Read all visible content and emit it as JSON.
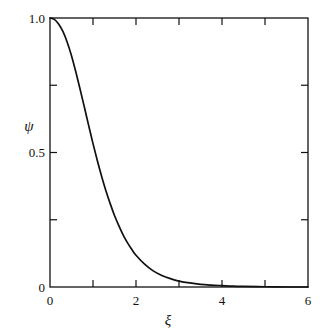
{
  "figure": {
    "background_color": "#ffffff",
    "frame_color": "#111111",
    "curve_color": "#111111"
  },
  "chart_data": {
    "type": "line",
    "title": "",
    "subtitle": "",
    "xlabel": "ξ",
    "ylabel": "ψ",
    "xlim": [
      0,
      6
    ],
    "ylim": [
      0,
      1.0
    ],
    "grid": false,
    "legend": false,
    "legend_position": "none",
    "x_ticks_major": [
      0,
      2,
      4,
      6
    ],
    "x_tick_labels": [
      "0",
      "2",
      "4",
      "6"
    ],
    "x_ticks_minor": [
      1,
      3,
      5
    ],
    "y_ticks_major": [
      0,
      0.5,
      1.0
    ],
    "y_tick_labels": [
      "0",
      "0.5",
      "1.0"
    ],
    "y_ticks_minor": [
      0.25,
      0.75
    ],
    "series": [
      {
        "name": "ψ(ξ)",
        "x": [
          0.0,
          0.1,
          0.2,
          0.3,
          0.4,
          0.5,
          0.6,
          0.7,
          0.8,
          0.9,
          1.0,
          1.1,
          1.2,
          1.3,
          1.4,
          1.5,
          1.6,
          1.7,
          1.8,
          1.9,
          2.0,
          2.2,
          2.4,
          2.6,
          2.8,
          3.0,
          3.25,
          3.5,
          3.75,
          4.0,
          4.25,
          4.5,
          5.0,
          5.5,
          6.0
        ],
        "values": [
          1.0,
          0.995,
          0.978,
          0.95,
          0.91,
          0.86,
          0.8,
          0.735,
          0.668,
          0.6,
          0.533,
          0.47,
          0.412,
          0.358,
          0.31,
          0.266,
          0.228,
          0.194,
          0.165,
          0.14,
          0.118,
          0.085,
          0.06,
          0.043,
          0.031,
          0.022,
          0.015,
          0.01,
          0.007,
          0.005,
          0.003,
          0.002,
          0.001,
          0.0,
          0.0
        ]
      }
    ]
  },
  "labels": {
    "y_top": "1.0",
    "y_mid": "0.5",
    "y_bottom": "0",
    "x_zero": "0",
    "x_two": "2",
    "x_four": "4",
    "x_six": "6",
    "y_axis_title": "ψ",
    "x_axis_title": "ξ"
  }
}
